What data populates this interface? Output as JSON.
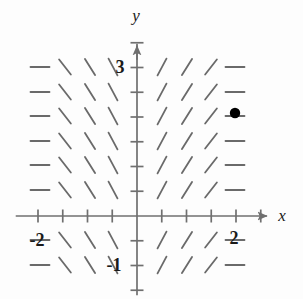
{
  "figure": {
    "kind": "slope-field",
    "background": "#fdfdfd",
    "ink": "#4a4a4a",
    "label_color": "#1a1a1a",
    "point_color": "#000000"
  },
  "axes": {
    "x_label": "x",
    "y_label": "y",
    "origin_px": [
      137,
      216
    ],
    "unit_px": 49.5,
    "x_range": [
      -2.45,
      2.95
    ],
    "y_range": [
      -1.6,
      3.6
    ],
    "tick_step": 0.5,
    "x_tick_labels": [
      {
        "value": -2,
        "text": "-2",
        "px": [
          37,
          240
        ]
      },
      {
        "value": 2,
        "text": "2",
        "px": [
          234,
          238
        ]
      }
    ],
    "y_tick_labels": [
      {
        "value": 3,
        "text": "3",
        "px": [
          120,
          67
        ]
      },
      {
        "value": -1,
        "text": "-1",
        "px": [
          114,
          265
        ]
      }
    ],
    "x_label_px": [
      282,
      215
    ],
    "y_label_px": [
      136,
      15
    ]
  },
  "chart_data": {
    "type": "scatter",
    "title": "",
    "xlabel": "x",
    "ylabel": "y",
    "xlim": [
      -2.45,
      2.95
    ],
    "ylim": [
      -1.6,
      3.6
    ],
    "grid": false,
    "legend": null,
    "field": {
      "description": "Direction field of dy/dx depending only on x: horizontal at x = -2 and x = 2, steepening toward the y-axis; negative slope for x < 0, positive slope for x > 0.",
      "columns_x": [
        -2,
        -1.5,
        -1,
        -0.5,
        0.5,
        1,
        1.5,
        2
      ],
      "rows_y": [
        3,
        2.5,
        2,
        1.5,
        1,
        0.5,
        -0.5,
        -1
      ],
      "row_pixels": [
        67,
        92,
        116,
        141,
        165,
        190,
        240,
        265
      ],
      "column_pixels": [
        40,
        65,
        90,
        113,
        162,
        187,
        211,
        235
      ],
      "slope_angles_deg": [
        0,
        -52,
        -58,
        -62,
        62,
        58,
        52,
        0
      ],
      "dash_length_px": 19,
      "dash_width_px": 1.8
    },
    "points": [
      {
        "label": "",
        "x": 2,
        "y": 2,
        "px": [
          235,
          113
        ],
        "radius_px": 5.2,
        "color": "#000000"
      }
    ]
  }
}
